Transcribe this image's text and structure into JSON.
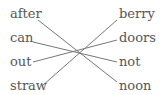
{
  "left_words": [
    "after",
    "can",
    "out",
    "straw"
  ],
  "right_words": [
    "berry",
    "doors",
    "not",
    "noon"
  ],
  "connections": [
    {
      "from": "after",
      "to": "noon"
    },
    {
      "from": "can",
      "to": "not"
    },
    {
      "from": "out",
      "to": "doors"
    },
    {
      "from": "straw",
      "to": "berry"
    }
  ],
  "colors": {
    "text": "#555555",
    "line": "#777777"
  }
}
